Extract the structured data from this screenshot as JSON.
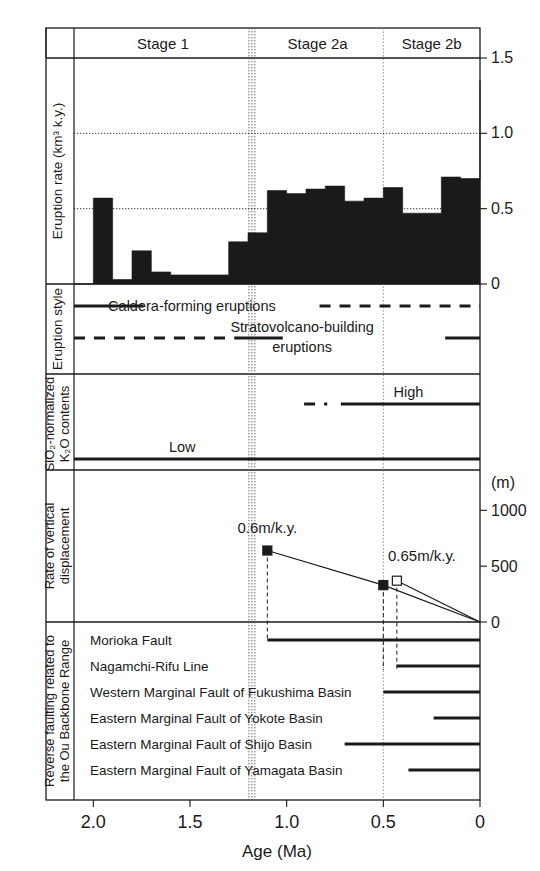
{
  "figure": {
    "xaxis": {
      "label": "Age (Ma)",
      "ticks": [
        "2.0",
        "1.5",
        "1.0",
        "0.5",
        "0"
      ],
      "tick_values": [
        2.0,
        1.5,
        1.0,
        0.5,
        0.0
      ],
      "range": [
        2.1,
        0.0
      ]
    },
    "stages": [
      {
        "label": "Stage 1",
        "from": 2.1,
        "to": 1.18
      },
      {
        "label": "Stage 2a",
        "from": 1.18,
        "to": 0.5
      },
      {
        "label": "Stage 2b",
        "from": 0.5,
        "to": 0.0
      }
    ],
    "stage_boundaries": [
      1.18,
      0.5
    ]
  },
  "chart_data": [
    {
      "type": "bar",
      "panel": "eruption-rate",
      "title": "",
      "ylabel": "Eruption rate (km³ k.y.)",
      "xlabel": "Age (Ma)",
      "ylim": [
        0,
        1.5
      ],
      "yticks": [
        0,
        0.5,
        1.0,
        1.5
      ],
      "ytick_labels": [
        "0",
        "0.5",
        "1.0",
        "1.5"
      ],
      "grid": "horizontal-dotted at 0.5 and 1.0",
      "xlim": [
        2.1,
        0.0
      ],
      "bin_edges": [
        2.1,
        2.0,
        1.9,
        1.8,
        1.7,
        1.6,
        1.5,
        1.4,
        1.3,
        1.2,
        1.1,
        1.0,
        0.9,
        0.8,
        0.7,
        0.6,
        0.5,
        0.4,
        0.3,
        0.2,
        0.1,
        0.0
      ],
      "values": [
        0.0,
        0.57,
        0.03,
        0.22,
        0.08,
        0.06,
        0.06,
        0.06,
        0.28,
        0.34,
        0.62,
        0.6,
        0.63,
        0.65,
        0.55,
        0.57,
        0.64,
        0.47,
        0.47,
        0.71,
        0.7,
        1.35
      ]
    },
    {
      "type": "timeline",
      "panel": "eruption-style",
      "ylabel": "Eruption style",
      "tracks": [
        {
          "name": "Caldera-forming eruptions",
          "label": "Caldera-forming eruptions",
          "label_age": 1.49,
          "segments": [
            {
              "from": 2.1,
              "to": 1.74,
              "style": "solid"
            },
            {
              "from": 0.83,
              "to": 0.0,
              "style": "dashed"
            }
          ]
        },
        {
          "name": "Stratovolcano-building eruptions",
          "label": "Stratovolcano-building\neruptions",
          "label_age": 0.92,
          "segments": [
            {
              "from": 2.1,
              "to": 1.27,
              "style": "dashed"
            },
            {
              "from": 1.27,
              "to": 1.02,
              "style": "solid"
            },
            {
              "from": 0.18,
              "to": 0.0,
              "style": "solid"
            }
          ]
        }
      ]
    },
    {
      "type": "timeline",
      "panel": "sio2-k2o",
      "ylabel": "SiO₂-normalized K₂O contents",
      "tracks": [
        {
          "name": "High",
          "label": "High",
          "label_age": 0.37,
          "segments": [
            {
              "from": 0.91,
              "to": 0.79,
              "style": "dashed"
            },
            {
              "from": 0.72,
              "to": 0.0,
              "style": "solid"
            }
          ]
        },
        {
          "name": "Low",
          "label": "Low",
          "label_age": 1.54,
          "segments": [
            {
              "from": 2.1,
              "to": 0.0,
              "style": "solid"
            }
          ]
        }
      ]
    },
    {
      "type": "line",
      "panel": "vertical-displacement",
      "ylabel": "Rate of vertical displacement",
      "y_unit": "(m)",
      "ylim": [
        0,
        1200
      ],
      "yticks": [
        0,
        500,
        1000
      ],
      "ytick_labels": [
        "0",
        "500",
        "1000"
      ],
      "series": [
        {
          "name": "0.6m/k.y.",
          "annotation": "0.6m/k.y.",
          "marker": "filled-square",
          "points": [
            {
              "x": 1.1,
              "y": 640
            },
            {
              "x": 0.5,
              "y": 330
            },
            {
              "x": 0.0,
              "y": 0
            }
          ]
        },
        {
          "name": "0.65m/k.y.",
          "annotation": "0.65m/k.y.",
          "marker": "open-square",
          "points": [
            {
              "x": 0.43,
              "y": 370
            },
            {
              "x": 0.0,
              "y": 0
            }
          ]
        }
      ]
    },
    {
      "type": "timeline",
      "panel": "reverse-faulting",
      "ylabel": "Reverse faulting related to the Ou Backbone Range",
      "tracks": [
        {
          "name": "Morioka Fault",
          "label": "Morioka Fault",
          "from": 1.1,
          "to": 0.0
        },
        {
          "name": "Nagamchi-Rifu Line",
          "label": "Nagamchi-Rifu Line",
          "from": 0.43,
          "to": 0.0
        },
        {
          "name": "Western Marginal Fault of Fukushima Basin",
          "label": "Western Marginal Fault of Fukushima Basin",
          "from": 0.5,
          "to": 0.0
        },
        {
          "name": "Eastern Marginal Fault of Yokote Basin",
          "label": "Eastern Marginal Fault of Yokote Basin",
          "from": 0.24,
          "to": 0.0
        },
        {
          "name": "Eastern Marginal Fault of Shijo Basin",
          "label": "Eastern Marginal Fault of Shijo Basin",
          "from": 0.7,
          "to": 0.0
        },
        {
          "name": "Eastern Marginal Fault of Yamagata Basin",
          "label": "Eastern Marginal Fault of Yamagata Basin",
          "from": 0.37,
          "to": 0.0
        }
      ]
    }
  ]
}
